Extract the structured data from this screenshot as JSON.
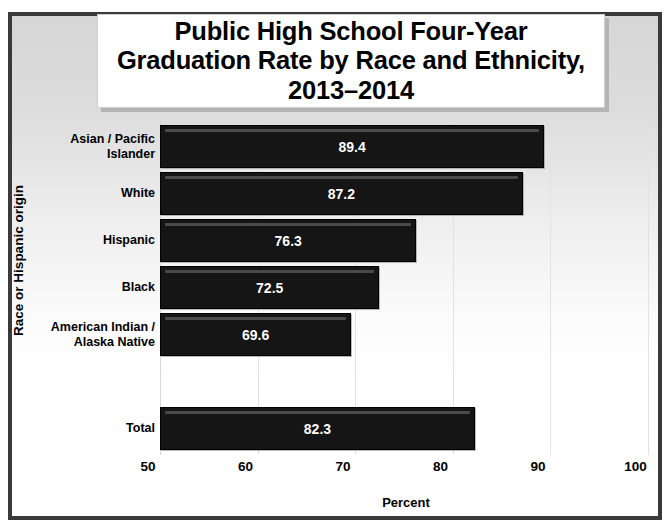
{
  "chart_data": {
    "type": "bar",
    "orientation": "horizontal",
    "title": "Public High School Four-Year\nGraduation Rate by Race and Ethnicity,\n2013–2014",
    "xlabel": "Percent",
    "ylabel": "Race or Hispanic origin",
    "xlim": [
      50,
      100
    ],
    "xticks": [
      "50",
      "60",
      "70",
      "80",
      "90",
      "100"
    ],
    "xtick_values": [
      50,
      60,
      70,
      80,
      90,
      100
    ],
    "grid": "vertical",
    "legend": "none",
    "bar_color": "#151515",
    "value_label_color": "#ffffff",
    "categories": [
      "Asian / Pacific\nIslander",
      "White",
      "Hispanic",
      "Black",
      "American Indian /\nAlaska Native",
      "",
      "Total"
    ],
    "values": [
      89.4,
      87.2,
      76.3,
      72.5,
      69.6,
      null,
      82.3
    ],
    "value_labels": [
      "89.4",
      "87.2",
      "76.3",
      "72.5",
      "69.6",
      "",
      "82.3"
    ],
    "bars": [
      {
        "category": "Asian / Pacific\nIslander",
        "value": 89.4,
        "label": "89.4"
      },
      {
        "category": "White",
        "value": 87.2,
        "label": "87.2"
      },
      {
        "category": "Hispanic",
        "value": 76.3,
        "label": "76.3"
      },
      {
        "category": "Black",
        "value": 72.5,
        "label": "72.5"
      },
      {
        "category": "American Indian /\nAlaska Native",
        "value": 69.6,
        "label": "69.6"
      },
      {
        "category": "",
        "value": null,
        "label": ""
      },
      {
        "category": "Total",
        "value": 82.3,
        "label": "82.3"
      }
    ]
  }
}
